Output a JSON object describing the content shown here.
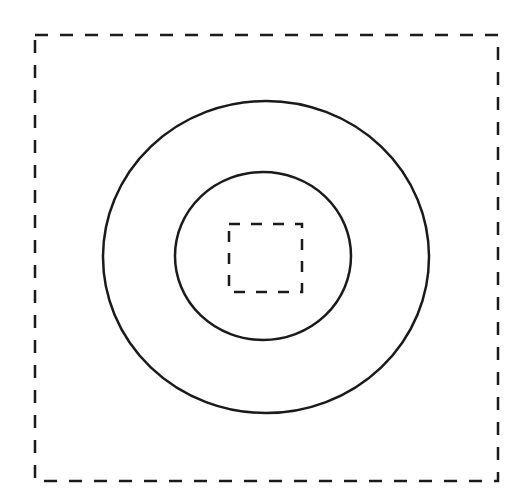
{
  "diagram": {
    "type": "concentric-shapes",
    "background": "#ffffff",
    "stroke_color": "#1a1a1a",
    "shapes": {
      "outer_rect": {
        "style": "dashed",
        "x": 35,
        "y": 35,
        "width": 463,
        "height": 446,
        "stroke_width": 2.5,
        "dasharray": "13 12"
      },
      "outer_circle": {
        "style": "solid",
        "cx": 266,
        "cy": 257,
        "rx": 163,
        "ry": 156,
        "stroke_width": 2.5
      },
      "inner_circle": {
        "style": "solid",
        "cx": 263,
        "cy": 256,
        "rx": 88,
        "ry": 84,
        "stroke_width": 2.5
      },
      "inner_rect": {
        "style": "dashed",
        "x": 229,
        "y": 224,
        "width": 73,
        "height": 68,
        "stroke_width": 2.5,
        "dasharray": "11 11"
      }
    }
  }
}
